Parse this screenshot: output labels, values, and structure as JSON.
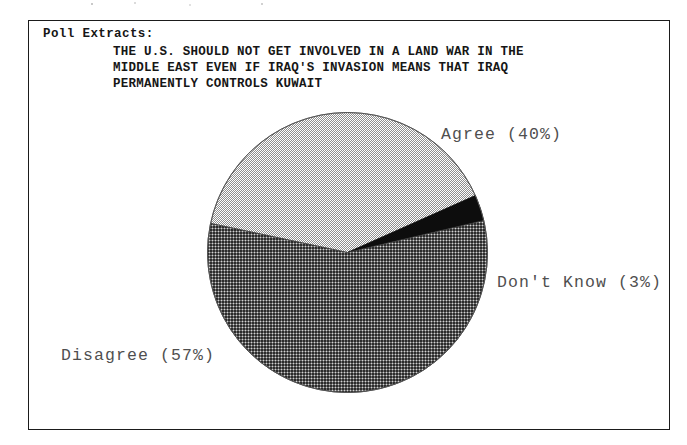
{
  "document": {
    "section_label": "Poll Extracts:",
    "question_lines": [
      "THE U.S. SHOULD NOT GET INVOLVED IN A LAND WAR IN THE",
      "MIDDLE EAST EVEN IF IRAQ'S INVASION MEANS THAT IRAQ",
      "PERMANENTLY CONTROLS KUWAIT"
    ]
  },
  "labels": {
    "agree": "Agree  (40%)",
    "dont_know": "Don't Know  (3%)",
    "disagree": "Disagree  (57%)"
  },
  "colors": {
    "ink": "#161616",
    "frame": "#1b1b1b",
    "label_text": "#4f4f4f",
    "agree_fill": "#b9b9b9",
    "disagree_fill": "#3a3a3a",
    "dont_know_fill": "#0d0d0d",
    "background": "#ffffff"
  },
  "chart_data": {
    "type": "pie",
    "title": "THE U.S. SHOULD NOT GET INVOLVED IN A LAND WAR IN THE MIDDLE EAST EVEN IF IRAQ'S INVASION MEANS THAT IRAQ PERMANENTLY CONTROLS KUWAIT",
    "subtitle": "Poll Extracts:",
    "categories": [
      "Agree",
      "Disagree",
      "Don't Know"
    ],
    "values": [
      40,
      57,
      3
    ],
    "value_unit": "percent",
    "labels": [
      "Agree  (40%)",
      "Disagree  (57%)",
      "Don't Know  (3%)"
    ],
    "slice_fills": [
      "light-stipple-gray",
      "dark-crosshatch",
      "solid-black"
    ],
    "legend": "none",
    "grid": false,
    "start_angle_deg": 168,
    "direction": "clockwise",
    "label_positions": [
      "right-top",
      "left-bottom",
      "right-middle"
    ]
  }
}
